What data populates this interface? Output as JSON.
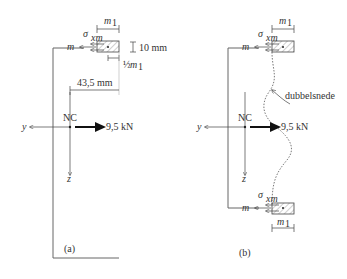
{
  "diagram": {
    "panels": [
      {
        "id": "a",
        "caption": "(a)",
        "labels": {
          "width_symbol": "m",
          "width_subscript": "1",
          "stress_symbol": "σ",
          "stress_subscript": "xm",
          "m_label": "m",
          "thickness": "10 mm",
          "half_width_frac": "½",
          "half_width_symbol": "m",
          "half_width_subscript": "1",
          "distance": "43,5 mm",
          "nc": "NC",
          "force": "9,5 kN",
          "y_axis": "y",
          "z_axis": "z"
        }
      },
      {
        "id": "b",
        "caption": "(b)",
        "labels": {
          "width_symbol": "m",
          "width_subscript": "1",
          "stress_symbol": "σ",
          "stress_subscript": "xm",
          "m_label": "m",
          "cut_label": "dubbelsnede",
          "nc": "NC",
          "force": "9,5 kN",
          "y_axis": "y",
          "z_axis": "z",
          "bottom_stress_symbol": "σ",
          "bottom_stress_subscript": "xm",
          "bottom_m_label": "m",
          "bottom_width_symbol": "m",
          "bottom_width_subscript": "1"
        }
      }
    ],
    "colors": {
      "line": "#666666",
      "text": "#333333",
      "hatch": "#888888"
    }
  }
}
